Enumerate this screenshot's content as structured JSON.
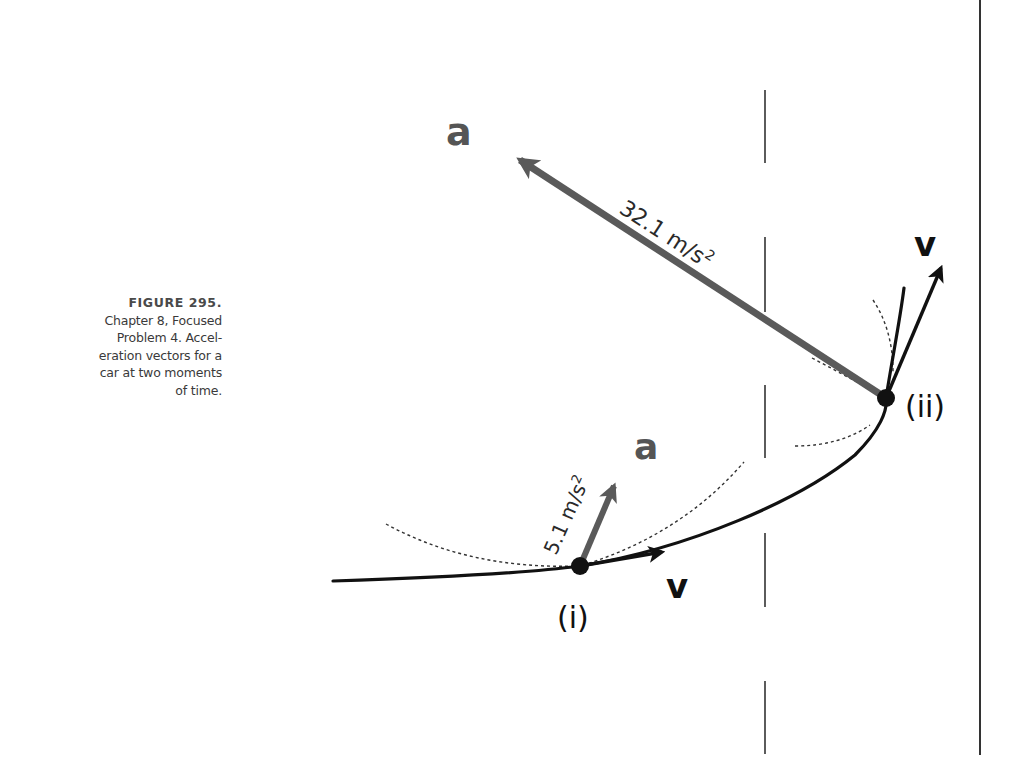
{
  "caption": {
    "title": "FIGURE 295.",
    "lines": [
      "Chapter 8, Focused",
      "Problem 4. Accel-",
      "eration vectors for a",
      "car at two moments",
      "of time."
    ]
  },
  "diagram": {
    "points": {
      "i": {
        "label": "(i)"
      },
      "ii": {
        "label": "(ii)"
      }
    },
    "vectors": {
      "a_i": {
        "symbol": "a",
        "magnitude": "5.1 m/s",
        "exponent": "2"
      },
      "a_ii": {
        "symbol": "a",
        "magnitude": "32.1 m/s",
        "exponent": "2"
      },
      "v_i": {
        "symbol": "v"
      },
      "v_ii": {
        "symbol": "v"
      }
    },
    "colors": {
      "path": "#111111",
      "acceleration": "#5a5a5a",
      "velocity": "#111111",
      "text": "#2a2a2a"
    }
  }
}
